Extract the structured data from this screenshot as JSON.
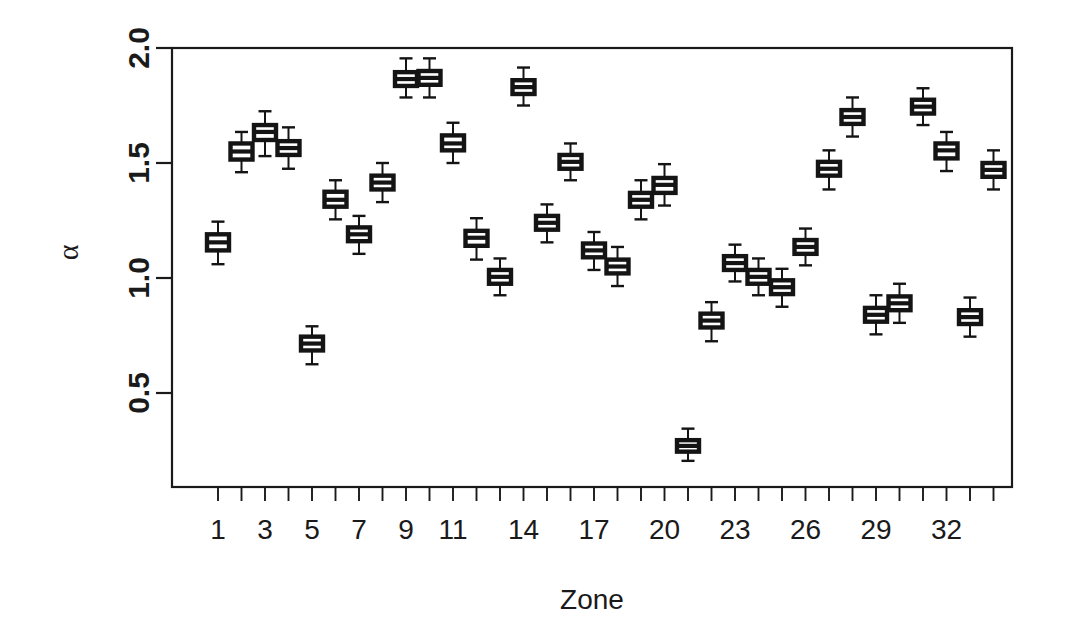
{
  "chart_data": {
    "type": "box",
    "title": "",
    "xlabel": "Zone",
    "ylabel": "α",
    "ylim": [
      0.13,
      2.02
    ],
    "xlim": [
      0.3,
      34.7
    ],
    "grid": false,
    "legend": null,
    "y_ticks": [
      0.5,
      1.0,
      1.5,
      2.0
    ],
    "y_tick_labels": [
      "0.5",
      "1.0",
      "1.5",
      "2.0"
    ],
    "x_ticks": [
      1,
      2,
      3,
      4,
      5,
      6,
      7,
      8,
      9,
      10,
      11,
      12,
      13,
      14,
      15,
      16,
      17,
      18,
      19,
      20,
      21,
      22,
      23,
      24,
      25,
      26,
      27,
      28,
      29,
      30,
      31,
      32,
      33,
      34
    ],
    "x_tick_labels_shown": [
      "1",
      "3",
      "5",
      "7",
      "9",
      "11",
      "14",
      "17",
      "20",
      "23",
      "26",
      "29",
      "32"
    ],
    "x_labeled_positions": [
      1,
      3,
      5,
      7,
      9,
      11,
      14,
      17,
      20,
      23,
      26,
      29,
      32
    ],
    "categories": [
      "1",
      "2",
      "3",
      "4",
      "5",
      "6",
      "7",
      "8",
      "9",
      "10",
      "11",
      "12",
      "13",
      "14",
      "15",
      "16",
      "17",
      "18",
      "19",
      "20",
      "21",
      "22",
      "23",
      "24",
      "25",
      "26",
      "27",
      "28",
      "29",
      "30",
      "31",
      "32",
      "33",
      "34"
    ],
    "boxes": [
      {
        "zone": 1,
        "whisker_low": 1.06,
        "q1": 1.12,
        "median": 1.155,
        "q3": 1.19,
        "whisker_high": 1.245
      },
      {
        "zone": 2,
        "whisker_low": 1.46,
        "q1": 1.515,
        "median": 1.55,
        "q3": 1.585,
        "whisker_high": 1.635
      },
      {
        "zone": 3,
        "whisker_low": 1.53,
        "q1": 1.6,
        "median": 1.635,
        "q3": 1.665,
        "whisker_high": 1.725
      },
      {
        "zone": 4,
        "whisker_low": 1.475,
        "q1": 1.535,
        "median": 1.565,
        "q3": 1.595,
        "whisker_high": 1.655
      },
      {
        "zone": 5,
        "whisker_low": 0.625,
        "q1": 0.685,
        "median": 0.715,
        "q3": 0.745,
        "whisker_high": 0.79
      },
      {
        "zone": 6,
        "whisker_low": 1.255,
        "q1": 1.31,
        "median": 1.34,
        "q3": 1.375,
        "whisker_high": 1.425
      },
      {
        "zone": 7,
        "whisker_low": 1.105,
        "q1": 1.16,
        "median": 1.19,
        "q3": 1.22,
        "whisker_high": 1.27
      },
      {
        "zone": 8,
        "whisker_low": 1.33,
        "q1": 1.385,
        "median": 1.415,
        "q3": 1.445,
        "whisker_high": 1.5
      },
      {
        "zone": 9,
        "whisker_low": 1.785,
        "q1": 1.835,
        "median": 1.865,
        "q3": 1.895,
        "whisker_high": 1.955
      },
      {
        "zone": 10,
        "whisker_low": 1.785,
        "q1": 1.84,
        "median": 1.87,
        "q3": 1.9,
        "whisker_high": 1.955
      },
      {
        "zone": 11,
        "whisker_low": 1.5,
        "q1": 1.555,
        "median": 1.585,
        "q3": 1.62,
        "whisker_high": 1.675
      },
      {
        "zone": 12,
        "whisker_low": 1.08,
        "q1": 1.14,
        "median": 1.175,
        "q3": 1.205,
        "whisker_high": 1.26
      },
      {
        "zone": 13,
        "whisker_low": 0.925,
        "q1": 0.975,
        "median": 1.005,
        "q3": 1.035,
        "whisker_high": 1.085
      },
      {
        "zone": 14,
        "whisker_low": 1.75,
        "q1": 1.8,
        "median": 1.83,
        "q3": 1.86,
        "whisker_high": 1.915
      },
      {
        "zone": 15,
        "whisker_low": 1.155,
        "q1": 1.21,
        "median": 1.24,
        "q3": 1.27,
        "whisker_high": 1.32
      },
      {
        "zone": 16,
        "whisker_low": 1.425,
        "q1": 1.475,
        "median": 1.505,
        "q3": 1.535,
        "whisker_high": 1.585
      },
      {
        "zone": 17,
        "whisker_low": 1.035,
        "q1": 1.09,
        "median": 1.12,
        "q3": 1.15,
        "whisker_high": 1.2
      },
      {
        "zone": 18,
        "whisker_low": 0.965,
        "q1": 1.02,
        "median": 1.05,
        "q3": 1.08,
        "whisker_high": 1.135
      },
      {
        "zone": 19,
        "whisker_low": 1.255,
        "q1": 1.31,
        "median": 1.34,
        "q3": 1.37,
        "whisker_high": 1.425
      },
      {
        "zone": 20,
        "whisker_low": 1.315,
        "q1": 1.37,
        "median": 1.405,
        "q3": 1.435,
        "whisker_high": 1.495
      },
      {
        "zone": 21,
        "whisker_low": 0.205,
        "q1": 0.245,
        "median": 0.27,
        "q3": 0.295,
        "whisker_high": 0.345
      },
      {
        "zone": 22,
        "whisker_low": 0.725,
        "q1": 0.785,
        "median": 0.815,
        "q3": 0.845,
        "whisker_high": 0.895
      },
      {
        "zone": 23,
        "whisker_low": 0.985,
        "q1": 1.035,
        "median": 1.065,
        "q3": 1.095,
        "whisker_high": 1.145
      },
      {
        "zone": 24,
        "whisker_low": 0.925,
        "q1": 0.975,
        "median": 1.005,
        "q3": 1.035,
        "whisker_high": 1.085
      },
      {
        "zone": 25,
        "whisker_low": 0.875,
        "q1": 0.93,
        "median": 0.96,
        "q3": 0.99,
        "whisker_high": 1.04
      },
      {
        "zone": 26,
        "whisker_low": 1.055,
        "q1": 1.105,
        "median": 1.135,
        "q3": 1.165,
        "whisker_high": 1.215
      },
      {
        "zone": 27,
        "whisker_low": 1.385,
        "q1": 1.445,
        "median": 1.475,
        "q3": 1.505,
        "whisker_high": 1.555
      },
      {
        "zone": 28,
        "whisker_low": 1.615,
        "q1": 1.67,
        "median": 1.7,
        "q3": 1.73,
        "whisker_high": 1.785
      },
      {
        "zone": 29,
        "whisker_low": 0.755,
        "q1": 0.81,
        "median": 0.84,
        "q3": 0.87,
        "whisker_high": 0.925
      },
      {
        "zone": 30,
        "whisker_low": 0.805,
        "q1": 0.86,
        "median": 0.89,
        "q3": 0.92,
        "whisker_high": 0.975
      },
      {
        "zone": 31,
        "whisker_low": 1.665,
        "q1": 1.715,
        "median": 1.745,
        "q3": 1.775,
        "whisker_high": 1.825
      },
      {
        "zone": 32,
        "whisker_low": 1.465,
        "q1": 1.52,
        "median": 1.555,
        "q3": 1.585,
        "whisker_high": 1.635
      },
      {
        "zone": 33,
        "whisker_low": 0.745,
        "q1": 0.8,
        "median": 0.83,
        "q3": 0.86,
        "whisker_high": 0.915
      },
      {
        "zone": 34,
        "whisker_low": 1.385,
        "q1": 1.44,
        "median": 1.47,
        "q3": 1.5,
        "whisker_high": 1.555
      }
    ]
  },
  "colors": {
    "ink": "#141414",
    "background": "#ffffff"
  }
}
